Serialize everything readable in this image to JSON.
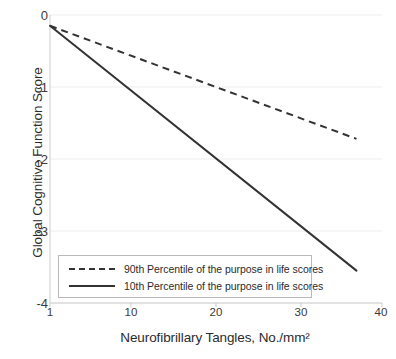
{
  "chart_data": {
    "type": "line",
    "title": "",
    "xlabel": "Neurofibrillary Tangles, No./mm²",
    "ylabel": "Global Cognitive Function Score",
    "xlim": [
      1,
      40
    ],
    "ylim": [
      -4,
      0
    ],
    "xticks": [
      1,
      10,
      20,
      30,
      40
    ],
    "xtick_labels": [
      "1",
      "10",
      "20",
      "30",
      "40"
    ],
    "yticks": [
      0,
      -1,
      -2,
      -3,
      -4
    ],
    "ytick_labels": [
      "0",
      "-1",
      "-2",
      "-3",
      "-4"
    ],
    "grid": true,
    "grid_axis": "y",
    "legend_position": "lower-left-inside",
    "series": [
      {
        "name": "90th Percentile of the purpose in life scores",
        "style": "dashed",
        "color": "#333333",
        "x": [
          1,
          37
        ],
        "y": [
          -0.15,
          -1.72
        ]
      },
      {
        "name": "10th Percentile of the purpose in life scores",
        "style": "solid",
        "color": "#333333",
        "x": [
          1,
          37
        ],
        "y": [
          -0.15,
          -3.55
        ]
      }
    ]
  },
  "legend": {
    "items": [
      {
        "label": "90th Percentile of the purpose in life scores",
        "style": "dashed"
      },
      {
        "label": "10th Percentile of the purpose in life scores",
        "style": "solid"
      }
    ]
  },
  "colors": {
    "line": "#333333",
    "grid": "#ededed",
    "axis": "#d9d9d9",
    "text": "#2b2b2b",
    "legend_border": "#b9b9b9"
  }
}
